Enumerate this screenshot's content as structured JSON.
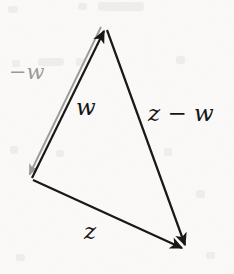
{
  "figure": {
    "kind": "vector-subtraction-triangle",
    "background_color": "#fbfaf8",
    "ink_color": "#141414",
    "ghost_color": "#9a9a9a",
    "canvas": {
      "width": 234,
      "height": 274
    },
    "vertices": {
      "top": {
        "x": 105,
        "y": 28
      },
      "left": {
        "x": 32,
        "y": 178
      },
      "bottom_right": {
        "x": 186,
        "y": 250
      }
    },
    "arrows": [
      {
        "name": "w",
        "label": "w",
        "color": "#141414",
        "from": {
          "x": 32,
          "y": 178
        },
        "to": {
          "x": 105,
          "y": 28
        },
        "arrowhead_at": "to",
        "stroke_width": 2.2
      },
      {
        "name": "minus-w",
        "label": "−w",
        "color": "#9a9a9a",
        "from": {
          "x": 101,
          "y": 27
        },
        "to": {
          "x": 27,
          "y": 179
        },
        "arrowhead_at": "to",
        "stroke_width": 1.9
      },
      {
        "name": "z",
        "label": "z",
        "color": "#141414",
        "from": {
          "x": 33,
          "y": 180
        },
        "to": {
          "x": 186,
          "y": 250
        },
        "arrowhead_at": "to",
        "stroke_width": 2.2
      },
      {
        "name": "z-minus-w",
        "label": "z − w",
        "color": "#141414",
        "from": {
          "x": 107,
          "y": 30
        },
        "to": {
          "x": 187,
          "y": 251
        },
        "arrowhead_at": "to",
        "stroke_width": 2.2
      }
    ],
    "labels": {
      "w": "w",
      "minus_w": "−w",
      "z": "z",
      "z_minus_w": "z − w"
    }
  }
}
